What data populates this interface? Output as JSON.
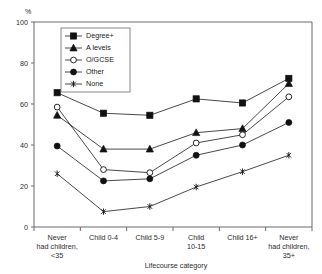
{
  "chart_data": {
    "type": "line",
    "title": "",
    "xlabel": "Lifecourse category",
    "ylabel": "%",
    "ylim": [
      0,
      100
    ],
    "yticks": [
      0,
      20,
      40,
      60,
      80,
      100
    ],
    "grid": false,
    "legend_position": "upper-left-inside",
    "categories": [
      "Never had children, <35",
      "Child 0-4",
      "Child 5-9",
      "Child 10-15",
      "Child 16+",
      "Never had children, 35+"
    ],
    "category_lines": [
      [
        "Never",
        "had children,",
        "<35"
      ],
      [
        "Child 0-4"
      ],
      [
        "Child 5-9"
      ],
      [
        "Child",
        "10-15"
      ],
      [
        "Child 16+"
      ],
      [
        "Never",
        "had children,",
        "35+"
      ]
    ],
    "series": [
      {
        "name": "Degree+",
        "marker": "filled-square",
        "values": [
          65.5,
          55.5,
          54.5,
          62.5,
          60.5,
          72.5
        ]
      },
      {
        "name": "A levels",
        "marker": "filled-triangle",
        "values": [
          54.5,
          38.0,
          38.0,
          46.0,
          48.0,
          70.0
        ]
      },
      {
        "name": "O/GCSE",
        "marker": "open-circle",
        "values": [
          58.5,
          28.0,
          26.5,
          41.0,
          45.0,
          63.5
        ]
      },
      {
        "name": "Other",
        "marker": "filled-circle",
        "values": [
          39.5,
          22.5,
          23.5,
          35.0,
          40.0,
          51.0
        ]
      },
      {
        "name": "None",
        "marker": "asterisk",
        "values": [
          26.0,
          7.5,
          10.0,
          19.5,
          27.0,
          35.0
        ]
      }
    ]
  },
  "legend": {
    "entries": [
      "Degree+",
      "A levels",
      "O/GCSE",
      "Other",
      "None"
    ]
  },
  "axes": {
    "y_unit": "%",
    "y_tick_labels": [
      "0",
      "20",
      "40",
      "60",
      "80",
      "100"
    ],
    "x_title": "Lifecourse category"
  },
  "colors": {
    "ink": "#111111",
    "axis": "#6b6b6b",
    "background": "#ffffff"
  }
}
